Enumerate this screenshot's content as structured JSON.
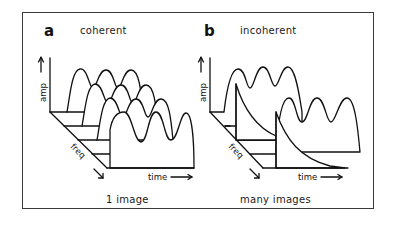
{
  "figure": {
    "panels": [
      {
        "letter": "a",
        "title": "coherent",
        "caption": "1 image",
        "axes": {
          "amp": "amp",
          "freq": "freq",
          "time": "time"
        },
        "description": "stack of 4 identical periodic waveforms (3 peaks each) offset along freq axis"
      },
      {
        "letter": "b",
        "title": "incoherent",
        "caption": "many images",
        "axes": {
          "amp": "amp",
          "freq": "freq",
          "time": "time"
        },
        "description": "2 periodic waveforms interleaved with 2 exponentially decaying pulses offset along freq axis"
      }
    ],
    "colors": {
      "ink": "#111111",
      "background": "#ffffff",
      "frame": "#3a3a3a"
    }
  }
}
